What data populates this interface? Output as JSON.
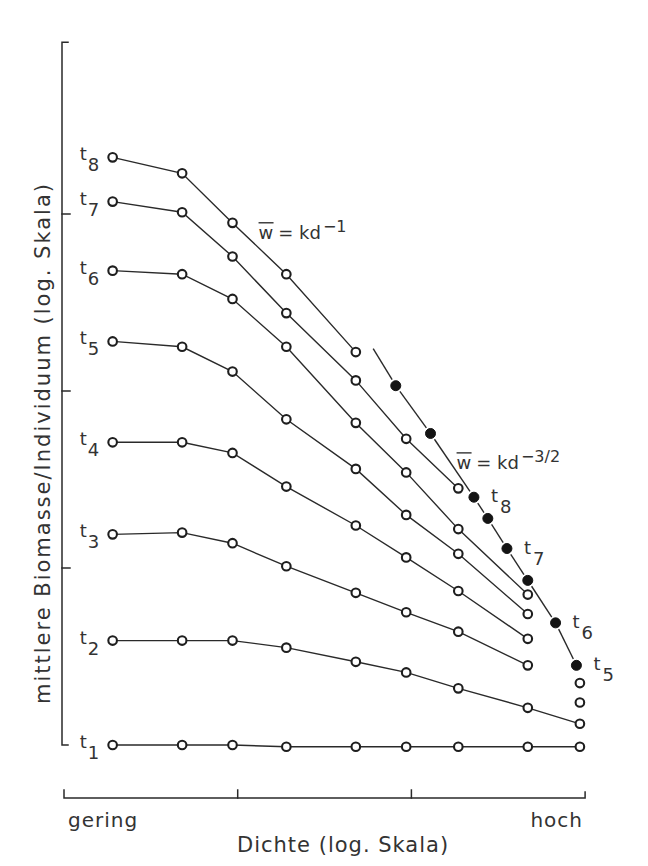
{
  "chart_data": {
    "type": "line",
    "title": "",
    "xlabel": "Dichte (log. Skala)",
    "ylabel": "mittlere Biomasse/Individuum (log. Skala)",
    "x_scale": "log",
    "y_scale": "log",
    "x_tick_labels": {
      "low": "gering",
      "high": "hoch"
    },
    "xlim": [
      0,
      3
    ],
    "ylim": [
      0,
      3.97
    ],
    "xticks": [
      0,
      1,
      2,
      3
    ],
    "yticks": [
      0,
      1,
      2,
      3
    ],
    "grid": false,
    "legend": "inline labels",
    "series": [
      {
        "name": "t1",
        "label": "t",
        "sub": "1",
        "marker": "open-circle",
        "points": [
          [
            0.28,
            0.0
          ],
          [
            0.68,
            0.0
          ],
          [
            0.97,
            0.0
          ],
          [
            1.28,
            -0.01
          ],
          [
            1.68,
            -0.01
          ],
          [
            1.97,
            -0.01
          ],
          [
            2.27,
            -0.01
          ],
          [
            2.67,
            -0.01
          ],
          [
            2.97,
            -0.01
          ]
        ],
        "unconnected_points": []
      },
      {
        "name": "t2",
        "label": "t",
        "sub": "2",
        "marker": "open-circle",
        "points": [
          [
            0.28,
            0.59
          ],
          [
            0.68,
            0.59
          ],
          [
            0.97,
            0.59
          ],
          [
            1.28,
            0.55
          ],
          [
            1.68,
            0.47
          ],
          [
            1.97,
            0.41
          ],
          [
            2.27,
            0.32
          ],
          [
            2.67,
            0.21
          ],
          [
            2.97,
            0.12
          ]
        ],
        "unconnected_points": []
      },
      {
        "name": "t3",
        "label": "t",
        "sub": "3",
        "marker": "open-circle",
        "points": [
          [
            0.28,
            1.19
          ],
          [
            0.68,
            1.2
          ],
          [
            0.97,
            1.14
          ],
          [
            1.28,
            1.01
          ],
          [
            1.68,
            0.86
          ],
          [
            1.97,
            0.75
          ],
          [
            2.27,
            0.64
          ],
          [
            2.67,
            0.45
          ]
        ],
        "unconnected_points": [
          [
            2.97,
            0.24
          ]
        ]
      },
      {
        "name": "t4",
        "label": "t",
        "sub": "4",
        "marker": "open-circle",
        "points": [
          [
            0.28,
            1.71
          ],
          [
            0.68,
            1.71
          ],
          [
            0.97,
            1.65
          ],
          [
            1.28,
            1.46
          ],
          [
            1.68,
            1.24
          ],
          [
            1.97,
            1.06
          ],
          [
            2.27,
            0.87
          ],
          [
            2.67,
            0.6
          ]
        ],
        "unconnected_points": [
          [
            2.97,
            0.35
          ]
        ]
      },
      {
        "name": "t5",
        "label": "t",
        "sub": "5",
        "marker": "open-circle",
        "points": [
          [
            0.28,
            2.28
          ],
          [
            0.68,
            2.25
          ],
          [
            0.97,
            2.11
          ],
          [
            1.28,
            1.84
          ],
          [
            1.68,
            1.56
          ],
          [
            1.97,
            1.3
          ],
          [
            2.27,
            1.08
          ],
          [
            2.67,
            0.74
          ]
        ],
        "unconnected_points": []
      },
      {
        "name": "t6",
        "label": "t",
        "sub": "6",
        "marker": "open-circle",
        "points": [
          [
            0.28,
            2.68
          ],
          [
            0.68,
            2.66
          ],
          [
            0.97,
            2.52
          ],
          [
            1.28,
            2.25
          ],
          [
            1.68,
            1.82
          ],
          [
            1.97,
            1.54
          ],
          [
            2.27,
            1.22
          ],
          [
            2.67,
            0.85
          ]
        ],
        "unconnected_points": []
      },
      {
        "name": "t7",
        "label": "t",
        "sub": "7",
        "marker": "open-circle",
        "points": [
          [
            0.28,
            3.07
          ],
          [
            0.68,
            3.01
          ],
          [
            0.97,
            2.76
          ],
          [
            1.28,
            2.44
          ],
          [
            1.68,
            2.06
          ],
          [
            1.97,
            1.73
          ],
          [
            2.27,
            1.45
          ]
        ],
        "unconnected_points": []
      },
      {
        "name": "t8",
        "label": "t",
        "sub": "8",
        "marker": "open-circle",
        "points": [
          [
            0.28,
            3.32
          ],
          [
            0.68,
            3.23
          ],
          [
            0.97,
            2.95
          ],
          [
            1.28,
            2.66
          ],
          [
            1.68,
            2.22
          ]
        ],
        "unconnected_points": []
      }
    ],
    "self_thinning": {
      "name": "w = kd^-3/2",
      "marker": "filled-circle",
      "line_start": [
        1.78,
        2.24
      ],
      "points": [
        {
          "x": 1.91,
          "y": 2.03
        },
        {
          "x": 2.11,
          "y": 1.76
        },
        {
          "x": 2.36,
          "y": 1.4,
          "label": "t",
          "sub": "8"
        },
        {
          "x": 2.44,
          "y": 1.28
        },
        {
          "x": 2.55,
          "y": 1.11,
          "label": "t",
          "sub": "7"
        },
        {
          "x": 2.67,
          "y": 0.93
        },
        {
          "x": 2.83,
          "y": 0.69,
          "label": "t",
          "sub": "6"
        },
        {
          "x": 2.95,
          "y": 0.45,
          "label": "t",
          "sub": "5"
        }
      ]
    },
    "annotations": [
      {
        "name": "slope-minus-1",
        "var": "w",
        "overline": true,
        "rhs": "= kd",
        "exponent": "−1",
        "x": 1.12,
        "y": 2.86
      },
      {
        "name": "slope-minus-3-2",
        "var": "w",
        "overline": true,
        "rhs": "= kd",
        "exponent": "−3/2",
        "x": 2.26,
        "y": 1.56
      }
    ]
  }
}
